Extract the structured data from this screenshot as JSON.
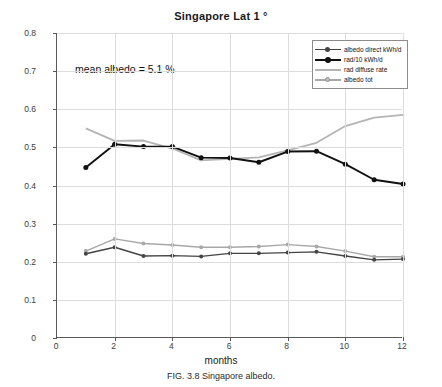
{
  "chart_data": {
    "type": "line",
    "title": "Singapore  Lat 1 °",
    "xlabel": "months",
    "ylabel": "kWh/day",
    "caption": "FIG. 3.8  Singapore albedo.",
    "annotation": "mean albedo = 5.1 %",
    "xlim": [
      0,
      12
    ],
    "ylim": [
      0,
      0.8
    ],
    "xticks": [
      0,
      2,
      4,
      6,
      8,
      10,
      12
    ],
    "xtick_labels": [
      "0",
      "2",
      "4",
      "6",
      "8",
      "10",
      "12"
    ],
    "yticks": [
      0,
      0.1,
      0.2,
      0.3,
      0.4,
      0.5,
      0.6,
      0.7,
      0.8
    ],
    "ytick_labels": [
      "0",
      "0.1",
      "0.2",
      "0.3",
      "0.4",
      "0.5",
      "0.6",
      "0.7",
      "0.8"
    ],
    "grid": true,
    "legend_position": "upper right",
    "x": [
      1,
      2,
      3,
      4,
      5,
      6,
      7,
      8,
      9,
      10,
      11,
      12
    ],
    "series": [
      {
        "name": "albedo direct kWh/d",
        "color": "#444444",
        "marker": "circle",
        "values": [
          0.221,
          0.238,
          0.215,
          0.216,
          0.214,
          0.222,
          0.222,
          0.224,
          0.226,
          0.215,
          0.205,
          0.207
        ]
      },
      {
        "name": "rad/10 kWh/d",
        "color": "#111111",
        "marker": "circle",
        "values": [
          0.447,
          0.508,
          0.502,
          0.502,
          0.473,
          0.472,
          0.461,
          0.489,
          0.49,
          0.456,
          0.415,
          0.404
        ]
      },
      {
        "name": "rad diffuse rate",
        "color": "#b4b4b4",
        "marker": "none",
        "values": [
          0.55,
          0.517,
          0.518,
          0.497,
          0.466,
          0.47,
          0.474,
          0.492,
          0.512,
          0.556,
          0.578,
          0.585
        ]
      },
      {
        "name": "albedo tot",
        "color": "#a8a8a8",
        "marker": "circle",
        "values": [
          0.228,
          0.26,
          0.248,
          0.244,
          0.238,
          0.238,
          0.24,
          0.245,
          0.24,
          0.228,
          0.213,
          0.213
        ]
      }
    ]
  },
  "legend": {
    "entries": [
      {
        "label": "albedo direct kWh/d"
      },
      {
        "label": "rad/10 kWh/d"
      },
      {
        "label": "rad diffuse rate"
      },
      {
        "label": "albedo tot"
      }
    ]
  }
}
